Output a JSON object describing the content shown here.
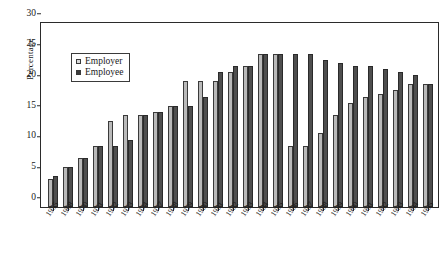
{
  "chart_data": {
    "type": "bar",
    "title": "",
    "xlabel": "",
    "ylabel": "Percentage",
    "ylim": [
      0,
      30
    ],
    "yticks": [
      0,
      5,
      10,
      15,
      20,
      25,
      30
    ],
    "grid": false,
    "legend_position": "upper-left-inside",
    "categories": [
      "1955",
      "1968",
      "1970",
      "1971",
      "1972",
      "1973",
      "1974",
      "1977",
      "1978",
      "1979",
      "1980",
      "1981",
      "1982",
      "1983",
      "1984",
      "1985",
      "1986",
      "1987",
      "1988",
      "1989",
      "1990",
      "1991",
      "1992",
      "1993",
      "1994",
      "1995"
    ],
    "series": [
      {
        "name": "Employer",
        "color": "#b9b9b9",
        "values": [
          4.5,
          6.5,
          8,
          10,
          14,
          15,
          15,
          15.5,
          16.5,
          20.5,
          20.5,
          20.5,
          22,
          23,
          25,
          25,
          10,
          10,
          12,
          15,
          17,
          18,
          18.5,
          19,
          20,
          20
        ]
      },
      {
        "name": "Employee",
        "color": "#4e4e4e",
        "values": [
          5,
          6.5,
          8,
          10,
          10,
          11,
          15,
          15.5,
          16.5,
          16.5,
          18,
          22,
          23,
          23,
          25,
          25,
          25,
          25,
          24,
          23.5,
          23,
          23,
          22.5,
          22,
          21.5,
          20
        ]
      }
    ]
  },
  "legend": {
    "items": [
      {
        "label": "Employer",
        "swatch": "employer-swatch"
      },
      {
        "label": "Employee",
        "swatch": "employee-swatch"
      }
    ]
  }
}
